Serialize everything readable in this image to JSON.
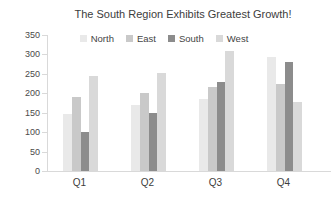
{
  "chart_data": {
    "type": "bar",
    "title": "The South Region Exhibits Greatest Growth!",
    "categories": [
      "Q1",
      "Q2",
      "Q3",
      "Q4"
    ],
    "series": [
      {
        "name": "North",
        "color": "#e9e9e9",
        "values": [
          148,
          170,
          185,
          293
        ]
      },
      {
        "name": "East",
        "color": "#c9c9c9",
        "values": [
          190,
          200,
          215,
          225
        ]
      },
      {
        "name": "South",
        "color": "#8c8c8c",
        "values": [
          100,
          150,
          228,
          280
        ]
      },
      {
        "name": "West",
        "color": "#d9d9d9",
        "values": [
          245,
          252,
          308,
          178
        ]
      }
    ],
    "xlabel": "",
    "ylabel": "",
    "ylim": [
      0,
      350
    ],
    "yticks": [
      0,
      50,
      100,
      150,
      200,
      250,
      300,
      350
    ],
    "grid": false,
    "legend_position": "top"
  },
  "style": {
    "axis_color": "#d9d9d9",
    "title_color": "#3d3d3d",
    "label_color": "#4a4a4a"
  }
}
